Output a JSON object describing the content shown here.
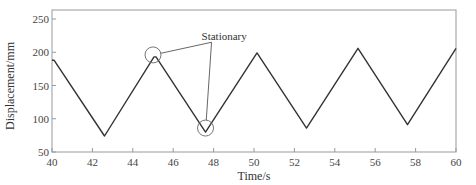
{
  "chart_data": {
    "type": "line",
    "title": "",
    "xlabel": "Time/s",
    "ylabel": "Displacement/mm",
    "xlim": [
      40,
      60
    ],
    "ylim": [
      50,
      265
    ],
    "xticks": [
      40,
      42,
      44,
      46,
      48,
      50,
      52,
      54,
      56,
      58,
      60
    ],
    "yticks": [
      50,
      100,
      150,
      200,
      250
    ],
    "grid": false,
    "legend": null,
    "series": [
      {
        "name": "displacement",
        "color": "#333333",
        "x": [
          40.0,
          40.1,
          42.6,
          45.05,
          45.15,
          47.6,
          50.15,
          52.6,
          55.15,
          57.6,
          60.0
        ],
        "y": [
          188,
          188,
          74,
          193,
          193,
          80,
          199,
          86,
          206,
          91,
          206
        ]
      }
    ],
    "annotations": [
      {
        "text": "Stationary",
        "label_x": 47.8,
        "label_y": 218,
        "targets": [
          {
            "x": 45.0,
            "y": 196,
            "circle": true
          },
          {
            "x": 47.6,
            "y": 86,
            "circle": true
          }
        ]
      }
    ]
  }
}
